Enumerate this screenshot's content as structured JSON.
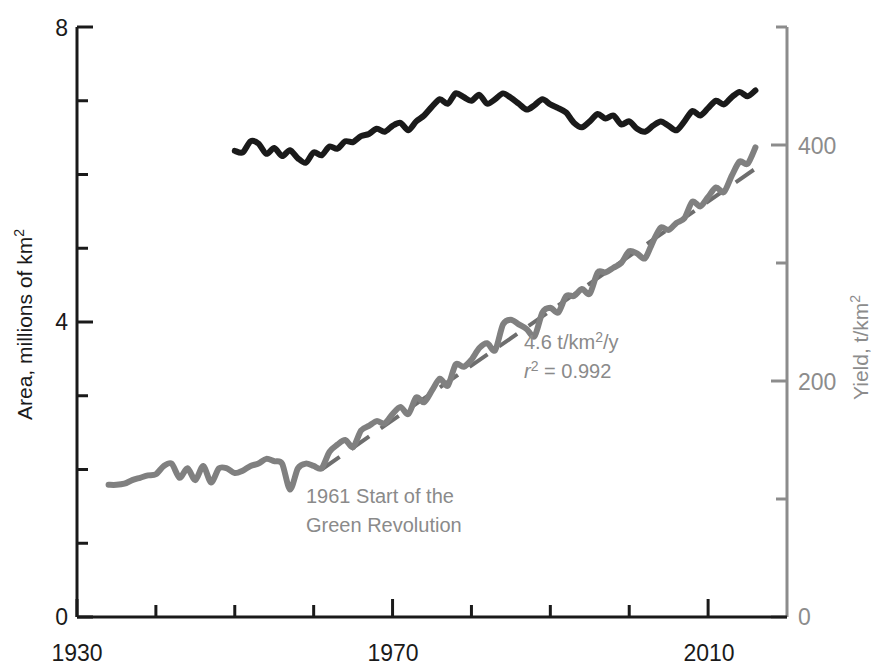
{
  "chart_data": {
    "type": "line",
    "title": "",
    "xlabel": "",
    "xlim": [
      1930,
      2020
    ],
    "x_ticks_major": [
      1930,
      1970,
      2010
    ],
    "x_tick_labels": [
      "1930",
      "1970",
      "2010"
    ],
    "x_ticks_minor": [
      1940,
      1950,
      1960,
      1980,
      1990,
      2000
    ],
    "grid": false,
    "legend_position": "none",
    "axes": [
      {
        "id": "left",
        "label": "Area, millions of km2",
        "label_display": "Area, millions of km²",
        "color": "#1a1a1a",
        "ylim": [
          0,
          8
        ],
        "ticks_major": [
          0,
          4,
          8
        ],
        "tick_labels": [
          "0",
          "4",
          "8"
        ],
        "ticks_minor": [
          1,
          2,
          3,
          5,
          6,
          7
        ]
      },
      {
        "id": "right",
        "label": "Yield, t/km2",
        "label_display": "Yield, t/km²",
        "color": "#8c8c8c",
        "ylim": [
          0,
          500
        ],
        "ticks_major": [
          0,
          200,
          400
        ],
        "tick_labels": [
          "0",
          "200",
          "400"
        ],
        "ticks_minor": [
          100,
          300,
          500
        ]
      }
    ],
    "series": [
      {
        "name": "Cereal area harvested",
        "axis": "left",
        "color": "#1a1a1a",
        "style": "solid",
        "x": [
          1950,
          1951,
          1952,
          1953,
          1954,
          1955,
          1956,
          1957,
          1958,
          1959,
          1960,
          1961,
          1962,
          1963,
          1964,
          1965,
          1966,
          1967,
          1968,
          1969,
          1970,
          1971,
          1972,
          1973,
          1974,
          1975,
          1976,
          1977,
          1978,
          1979,
          1980,
          1981,
          1982,
          1983,
          1984,
          1985,
          1986,
          1987,
          1988,
          1989,
          1990,
          1991,
          1992,
          1993,
          1994,
          1995,
          1996,
          1997,
          1998,
          1999,
          2000,
          2001,
          2002,
          2003,
          2004,
          2005,
          2006,
          2007,
          2008,
          2009,
          2010,
          2011,
          2012,
          2013,
          2014,
          2015,
          2016
        ],
        "y": [
          6.32,
          6.3,
          6.45,
          6.42,
          6.28,
          6.36,
          6.25,
          6.33,
          6.22,
          6.16,
          6.3,
          6.26,
          6.38,
          6.35,
          6.45,
          6.44,
          6.52,
          6.55,
          6.62,
          6.58,
          6.66,
          6.7,
          6.6,
          6.72,
          6.8,
          6.92,
          7.02,
          6.96,
          7.1,
          7.05,
          7.0,
          7.08,
          6.96,
          7.02,
          7.1,
          7.04,
          6.96,
          6.88,
          6.94,
          7.02,
          6.95,
          6.9,
          6.84,
          6.7,
          6.64,
          6.72,
          6.82,
          6.76,
          6.8,
          6.68,
          6.72,
          6.62,
          6.58,
          6.66,
          6.72,
          6.66,
          6.6,
          6.72,
          6.86,
          6.8,
          6.9,
          7.0,
          6.95,
          7.05,
          7.12,
          7.06,
          7.14
        ]
      },
      {
        "name": "Cereal yield",
        "axis": "right",
        "color": "#808080",
        "style": "solid",
        "x": [
          1934,
          1935,
          1936,
          1937,
          1938,
          1939,
          1940,
          1941,
          1942,
          1943,
          1944,
          1945,
          1946,
          1947,
          1948,
          1949,
          1950,
          1951,
          1952,
          1953,
          1954,
          1955,
          1956,
          1957,
          1958,
          1959,
          1960,
          1961,
          1962,
          1963,
          1964,
          1965,
          1966,
          1967,
          1968,
          1969,
          1970,
          1971,
          1972,
          1973,
          1974,
          1975,
          1976,
          1977,
          1978,
          1979,
          1980,
          1981,
          1982,
          1983,
          1984,
          1985,
          1986,
          1987,
          1988,
          1989,
          1990,
          1991,
          1992,
          1993,
          1994,
          1995,
          1996,
          1997,
          1998,
          1999,
          2000,
          2001,
          2002,
          2003,
          2004,
          2005,
          2006,
          2007,
          2008,
          2009,
          2010,
          2011,
          2012,
          2013,
          2014,
          2015,
          2016
        ],
        "y": [
          112,
          112,
          113,
          116,
          118,
          120,
          121,
          128,
          130,
          118,
          126,
          116,
          128,
          114,
          126,
          126,
          122,
          124,
          128,
          130,
          134,
          132,
          130,
          108,
          126,
          130,
          128,
          126,
          140,
          146,
          150,
          144,
          158,
          162,
          166,
          164,
          172,
          178,
          172,
          186,
          182,
          192,
          202,
          196,
          214,
          212,
          218,
          228,
          232,
          226,
          248,
          252,
          248,
          244,
          238,
          258,
          262,
          258,
          272,
          272,
          278,
          274,
          292,
          292,
          296,
          300,
          310,
          308,
          304,
          318,
          330,
          328,
          334,
          338,
          352,
          348,
          356,
          364,
          360,
          374,
          386,
          384,
          398
        ]
      },
      {
        "name": "Yield trend line",
        "axis": "right",
        "color": "#6e6e6e",
        "style": "dashed",
        "x": [
          1961,
          2016
        ],
        "y": [
          125,
          380
        ]
      }
    ],
    "annotations": [
      {
        "id": "trend-rate",
        "lines": [
          "4.6 t/km2/y",
          "r2 = 0.992"
        ],
        "lines_display": [
          "4.6 t/km²/y",
          "r² = 0.992"
        ],
        "color": "#8a8a8a"
      },
      {
        "id": "green-revolution",
        "lines": [
          "1961 Start of the",
          "Green Revolution"
        ],
        "lines_display": [
          "1961 Start of the",
          "Green Revolution"
        ],
        "color": "#8a8a8a"
      }
    ]
  },
  "colors": {
    "black_series": "#1a1a1a",
    "gray_series": "#808080",
    "gray_axis": "#8c8c8c",
    "background": "#ffffff"
  },
  "labels": {
    "left_axis_title_main": "Area, millions of km",
    "left_axis_title_sup": "2",
    "right_axis_title_main": "Yield, t/km",
    "right_axis_title_sup": "2",
    "y_left_top": "8",
    "y_left_mid": "4",
    "y_left_bottom": "0",
    "y_right_top": "400",
    "y_right_mid": "200",
    "y_right_bottom": "0",
    "x_first": "1930",
    "x_second": "1970",
    "x_third": "2010",
    "annot_rate_main": "4.6 t/km",
    "annot_rate_sup": "2",
    "annot_rate_tail": "/y",
    "annot_r2_r": "r",
    "annot_r2_sup": "2",
    "annot_r2_tail": " = 0.992",
    "annot_gr_line1": "1961 Start of the",
    "annot_gr_line2": "Green Revolution"
  }
}
